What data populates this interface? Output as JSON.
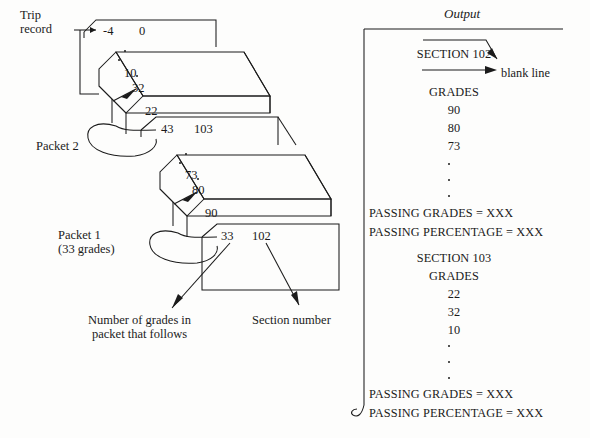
{
  "figure": {
    "background_color": "#fdfdfc",
    "ink_color": "#1b1b1b"
  },
  "left_diagram": {
    "trip_record_label": "Trip\nrecord",
    "packet2_label": "Packet 2",
    "packet1_label": "Packet 1\n(33 grades)",
    "caption_number_of_grades": "Number of grades in\npacket that follows",
    "caption_section_number": "Section number",
    "cards": [
      {
        "name": "trip-record-card",
        "values": [
          "-4",
          "0"
        ]
      },
      {
        "name": "packet-2-deck",
        "values": [
          "10",
          "32",
          "22"
        ]
      },
      {
        "name": "packet-2-header-card",
        "values": [
          "43",
          "103"
        ]
      },
      {
        "name": "packet-1-deck",
        "values": [
          "73",
          "80",
          "90"
        ]
      },
      {
        "name": "packet-1-header-card",
        "values": [
          "33",
          "102"
        ]
      }
    ],
    "card_numbers": {
      "minus4": "-4",
      "zero": "0",
      "ten": "10",
      "thirtytwo": "32",
      "twentytwo": "22",
      "fortythree": "43",
      "onehundredthree": "103",
      "seventythree": "73",
      "eighty": "80",
      "ninety": "90",
      "thirtythree": "33",
      "onehundredtwo": "102"
    }
  },
  "output_panel": {
    "title": "Output",
    "blank_line_label": "blank line",
    "lines": [
      {
        "text": "SECTION 102",
        "align": "center"
      },
      {
        "text": "GRADES",
        "align": "center"
      },
      {
        "text": "90",
        "align": "center"
      },
      {
        "text": "80",
        "align": "center"
      },
      {
        "text": "73",
        "align": "center"
      },
      {
        "text": "PASSING GRADES = XXX",
        "align": "left"
      },
      {
        "text": "PASSING PERCENTAGE = XXX",
        "align": "left"
      },
      {
        "text": "SECTION 103",
        "align": "center"
      },
      {
        "text": "GRADES",
        "align": "center"
      },
      {
        "text": "22",
        "align": "center"
      },
      {
        "text": "32",
        "align": "center"
      },
      {
        "text": "10",
        "align": "center"
      },
      {
        "text": "PASSING GRADES = XXX",
        "align": "left"
      },
      {
        "text": "PASSING PERCENTAGE = XXX",
        "align": "left"
      }
    ]
  }
}
